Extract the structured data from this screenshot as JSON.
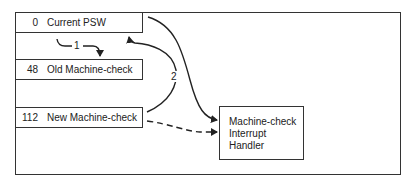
{
  "diagram": {
    "memory_slots": [
      {
        "address": "0",
        "label": "Current PSW"
      },
      {
        "address": "48",
        "label": "Old Machine-check"
      },
      {
        "address": "112",
        "label": "New Machine-check"
      }
    ],
    "handler": {
      "lines": [
        "Machine-check",
        "Interrupt",
        "Handler"
      ]
    },
    "steps": [
      {
        "number": "1",
        "description": "Current PSW stored into Old Machine-check"
      },
      {
        "number": "2",
        "description": "New Machine-check loaded into Current PSW"
      }
    ],
    "colors": {
      "line": "#222222",
      "background": "#ffffff"
    }
  }
}
